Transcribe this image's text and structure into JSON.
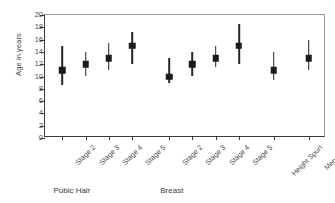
{
  "chart_data": {
    "type": "scatter",
    "title": "",
    "xlabel": "",
    "ylabel": "Age in years",
    "ylim": [
      0,
      20
    ],
    "yticks": [
      0,
      2,
      4,
      6,
      8,
      10,
      12,
      14,
      16,
      18,
      20
    ],
    "grid": false,
    "legend": null,
    "categories": [
      "Stage 2",
      "Stage 3",
      "Stage 4",
      "Stage 5",
      "Stage 2",
      "Stage 3",
      "Stage 4",
      "Stage 5",
      "Height Spurt",
      "Menarche"
    ],
    "values": [
      11.0,
      12.0,
      13.0,
      15.0,
      10.0,
      12.0,
      13.0,
      15.0,
      11.0,
      13.0
    ],
    "low": [
      8.6,
      10.0,
      11.1,
      12.1,
      9.0,
      10.0,
      11.5,
      12.0,
      9.5,
      11.0
    ],
    "high": [
      15.0,
      14.0,
      15.4,
      17.3,
      13.0,
      14.0,
      15.0,
      18.6,
      14.0,
      16.0
    ],
    "points": [
      {
        "label": "Stage 2",
        "group": "Pubic Hair",
        "x": 1,
        "value": 11.0,
        "low": 8.6,
        "high": 15.0
      },
      {
        "label": "Stage 3",
        "group": "Pubic Hair",
        "x": 2,
        "value": 12.0,
        "low": 10.0,
        "high": 14.0
      },
      {
        "label": "Stage 4",
        "group": "Pubic Hair",
        "x": 3,
        "value": 13.0,
        "low": 11.1,
        "high": 15.4
      },
      {
        "label": "Stage 5",
        "group": "Pubic Hair",
        "x": 4,
        "value": 15.0,
        "low": 12.1,
        "high": 17.3
      },
      {
        "label": "Stage 2",
        "group": "Breast",
        "x": 5.6,
        "value": 10.0,
        "low": 9.0,
        "high": 13.0
      },
      {
        "label": "Stage 3",
        "group": "Breast",
        "x": 6.6,
        "value": 12.0,
        "low": 10.0,
        "high": 14.0
      },
      {
        "label": "Stage 4",
        "group": "Breast",
        "x": 7.6,
        "value": 13.0,
        "low": 11.5,
        "high": 15.0
      },
      {
        "label": "Stage 5",
        "group": "Breast",
        "x": 8.6,
        "value": 15.0,
        "low": 12.0,
        "high": 18.6
      },
      {
        "label": "Height Spurt",
        "group": "",
        "x": 10.1,
        "value": 11.0,
        "low": 9.5,
        "high": 14.0
      },
      {
        "label": "Menarche",
        "group": "",
        "x": 11.6,
        "value": 13.0,
        "low": 11.0,
        "high": 16.0
      }
    ],
    "group_labels": [
      {
        "text": "Pubic Hair",
        "x": 1
      },
      {
        "text": "Breast",
        "x": 5.6
      }
    ]
  }
}
